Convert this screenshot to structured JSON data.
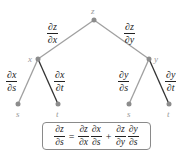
{
  "diagram": {
    "type": "tree-diagram",
    "nodes": {
      "root": "z",
      "mid_left": "x",
      "mid_right": "y",
      "leaf_left_s": "s",
      "leaf_left_t": "t",
      "leaf_right_s": "s",
      "leaf_right_t": "t"
    },
    "edges": {
      "z_x": {
        "num": "∂z",
        "den": "∂x"
      },
      "z_y": {
        "num": "∂z",
        "den": "∂y"
      },
      "x_s": {
        "num": "∂x",
        "den": "∂s"
      },
      "x_t": {
        "num": "∂x",
        "den": "∂t"
      },
      "y_s": {
        "num": "∂y",
        "den": "∂s"
      },
      "y_t": {
        "num": "∂y",
        "den": "∂t"
      }
    },
    "formula": {
      "lhs": {
        "num": "∂z",
        "den": "∂s"
      },
      "eq": "=",
      "term1a": {
        "num": "∂z",
        "den": "∂x"
      },
      "term1b": {
        "num": "∂x",
        "den": "∂s"
      },
      "plus": "+",
      "term2a": {
        "num": "∂z",
        "den": "∂y"
      },
      "term2b": {
        "num": "∂y",
        "den": "∂s"
      }
    },
    "colors": {
      "gray_edge": "#a0a0a0",
      "dark_edge": "#333333",
      "node": "#8c8c8c"
    }
  }
}
